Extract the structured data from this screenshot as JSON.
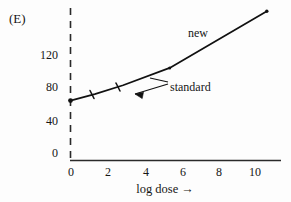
{
  "figure": {
    "panel_label": "(E)",
    "background_color": "#fdfdfd",
    "ink_color": "#161616"
  },
  "chart_data": {
    "type": "line",
    "title": "",
    "subtitle": "",
    "panel": "(E)",
    "xlabel": "log dose →",
    "ylabel": "",
    "xlim": [
      0,
      10.4
    ],
    "ylim": [
      0,
      140
    ],
    "xticks": [
      0,
      2,
      4,
      6,
      8,
      10
    ],
    "xtick_labels": [
      "0",
      "2",
      "4",
      "6",
      "8",
      "10"
    ],
    "yticks": [
      0,
      40,
      80,
      120
    ],
    "ytick_labels": [
      "0",
      "40",
      "80",
      "120"
    ],
    "grid": false,
    "legend": "inline-annotations",
    "y_axis_style": "dashed",
    "x_axis_style": "solid",
    "annotations": [
      {
        "text": "new",
        "x": 6.4,
        "y": 122,
        "kind": "series-label",
        "points_to": "upper steep segment"
      },
      {
        "text": "standard",
        "x": 5.5,
        "y": 73,
        "kind": "series-label-with-leader",
        "points_to": "lower shallow segment"
      }
    ],
    "series": [
      {
        "name": "standard",
        "marker": "tick",
        "x": [
          0.0,
          1.2,
          2.6,
          4.9
        ],
        "y": [
          55,
          61,
          69,
          85
        ]
      },
      {
        "name": "new",
        "marker": "dot",
        "x": [
          4.9,
          9.7
        ],
        "y": [
          85,
          137
        ]
      }
    ],
    "curve_points": [
      {
        "x": 0.0,
        "y": 55
      },
      {
        "x": 1.2,
        "y": 61
      },
      {
        "x": 2.6,
        "y": 69
      },
      {
        "x": 4.9,
        "y": 85
      },
      {
        "x": 9.7,
        "y": 137
      }
    ]
  },
  "labels": {
    "y": [
      {
        "value": "120"
      },
      {
        "value": "80"
      },
      {
        "value": "40"
      },
      {
        "value": "0"
      }
    ],
    "x": [
      {
        "value": "0"
      },
      {
        "value": "2"
      },
      {
        "value": "4"
      },
      {
        "value": "6"
      },
      {
        "value": "8"
      },
      {
        "value": "10"
      }
    ],
    "x_axis_title": "log dose →",
    "series_new": "new",
    "series_standard": "standard"
  }
}
